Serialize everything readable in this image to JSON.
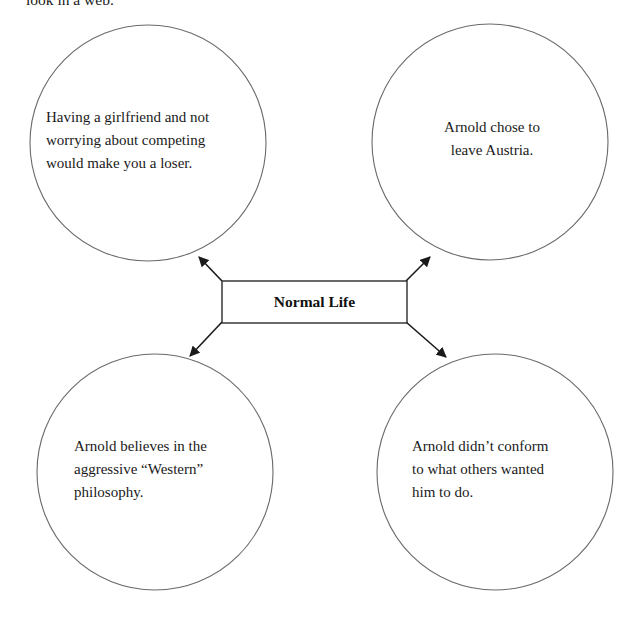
{
  "page": {
    "width": 629,
    "height": 617,
    "background": "#ffffff",
    "truncated_caption": "look in a web."
  },
  "diagram": {
    "type": "web-organizer",
    "center": {
      "label": "Normal Life",
      "shape": "rectangle",
      "bold": true
    },
    "nodes": [
      {
        "id": "top-left",
        "shape": "circle",
        "text": "Having a girlfriend and not worrying about competing would make you a loser.",
        "lines": [
          "Having a girlfriend and not",
          "worrying about competing",
          "would make you a loser."
        ],
        "align": "left"
      },
      {
        "id": "top-right",
        "shape": "circle",
        "text": "Arnold chose to leave Austria.",
        "lines": [
          "Arnold chose to",
          "leave Austria."
        ],
        "align": "center"
      },
      {
        "id": "bottom-left",
        "shape": "circle",
        "text": "Arnold believes in the aggressive “Western” philosophy.",
        "lines": [
          "Arnold believes in the",
          "aggressive “Western”",
          "philosophy."
        ],
        "align": "left"
      },
      {
        "id": "bottom-right",
        "shape": "circle",
        "text": "Arnold didn’t conform to what others wanted him to do.",
        "lines": [
          "Arnold didn’t conform",
          "to what others wanted",
          "him to do."
        ],
        "align": "left"
      }
    ],
    "connectors": [
      {
        "from": "center",
        "to": "top-left",
        "arrowhead": "end"
      },
      {
        "from": "center",
        "to": "top-right",
        "arrowhead": "end"
      },
      {
        "from": "center",
        "to": "bottom-left",
        "arrowhead": "end"
      },
      {
        "from": "center",
        "to": "bottom-right",
        "arrowhead": "end"
      }
    ],
    "colors": {
      "circle_stroke": "#6a6a6a",
      "box_stroke": "#2b2b2b",
      "connector_stroke": "#1a1a1a",
      "text": "#1a1a1a",
      "fill": "#ffffff"
    }
  }
}
